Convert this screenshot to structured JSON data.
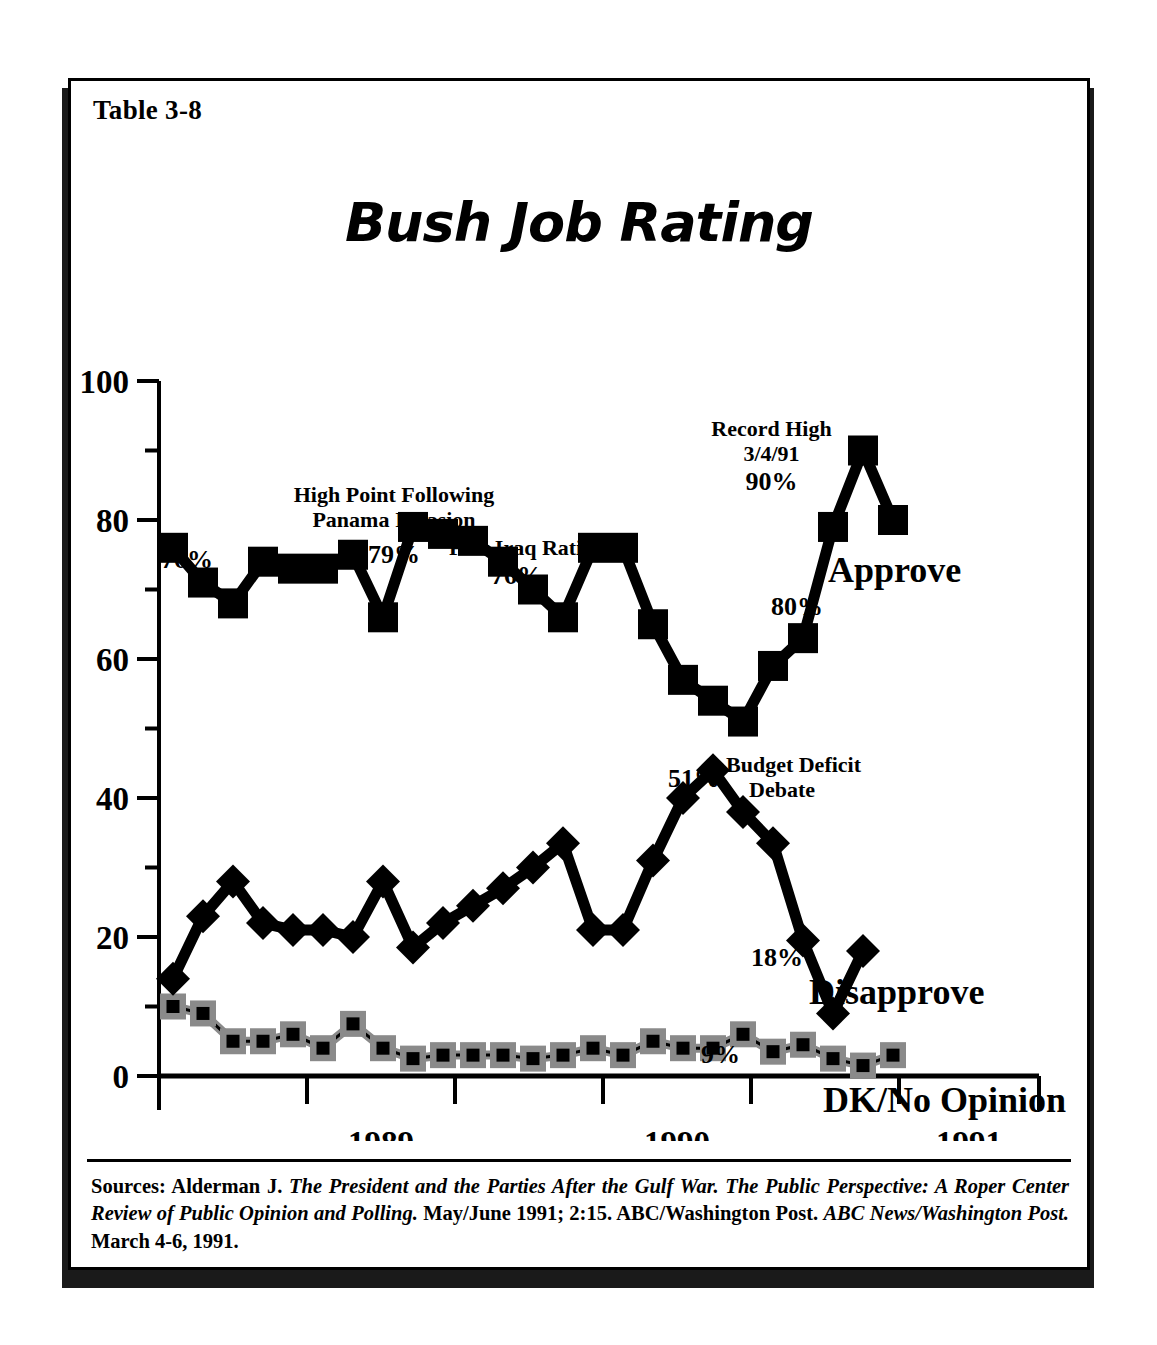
{
  "table_label": "Table 3-8",
  "title": "Bush Job Rating",
  "axes": {
    "y_ticks": [
      0,
      20,
      40,
      60,
      80,
      100
    ],
    "y_minor_ticks": [
      10,
      30,
      50,
      70,
      90
    ],
    "x_labels": [
      "1989",
      "1990",
      "1991"
    ]
  },
  "annotations": {
    "start_value": "76%",
    "panama_line1": "High Point Following",
    "panama_line2": "Panama Invasion",
    "panama_value": "79%",
    "iraq_line1": "Post Iraq Rating",
    "iraq_value": "76%",
    "record_line1": "Record High",
    "record_line2": "3/4/91",
    "record_value": "90%",
    "approve_end_value": "80%",
    "budget_value": "51%",
    "budget_line1": "Budget Deficit",
    "budget_line2": "Debate",
    "disapprove_end_value": "18%",
    "disapprove_low_value": "9%"
  },
  "series_labels": {
    "approve": "Approve",
    "disapprove": "Disapprove",
    "dk": "DK/No Opinion"
  },
  "colors": {
    "ink": "#000000",
    "dk_marker": "#8a8a8a",
    "background": "#ffffff"
  },
  "sources": {
    "prefix": "Sources: Alderman J. ",
    "italic1": "The President and the Parties After the Gulf War. The Public Perspective: A Roper Center Review of Public Opinion and Polling.",
    "mid": " May/June 1991; 2:15. ABC/Washington Post. ",
    "italic2": "ABC News/Washington Post.",
    "suffix": " March 4-6, 1991."
  },
  "chart_data": {
    "type": "line",
    "title": "Bush Job Rating",
    "xlabel": "",
    "ylabel": "",
    "ylim": [
      0,
      100
    ],
    "xlim": [
      0,
      29
    ],
    "grid": false,
    "legend": "inline-right",
    "x_tick_labels": [
      "1989",
      "1990",
      "1991"
    ],
    "x": [
      0,
      1,
      2,
      3,
      4,
      5,
      6,
      7,
      8,
      9,
      10,
      11,
      12,
      13,
      14,
      15,
      16,
      17,
      18,
      19,
      20,
      21,
      22,
      23,
      24,
      25,
      26,
      27,
      28
    ],
    "series": [
      {
        "name": "Approve",
        "marker": "square",
        "color": "#000000",
        "values": [
          76,
          71,
          68,
          74,
          73,
          73,
          75,
          66,
          79,
          78,
          77,
          74,
          70,
          66,
          76,
          76,
          65,
          57,
          54,
          51,
          59,
          63,
          79,
          90,
          80,
          null,
          null,
          null,
          null
        ]
      },
      {
        "name": "Disapprove",
        "marker": "diamond",
        "color": "#000000",
        "values": [
          14,
          23,
          28,
          22,
          21,
          21,
          20,
          28,
          18.5,
          22,
          24.5,
          27,
          30,
          33.5,
          21,
          21,
          31,
          40,
          44,
          38,
          33.5,
          19.5,
          9,
          18,
          null,
          null,
          null,
          null,
          null
        ]
      },
      {
        "name": "DK/No Opinion",
        "marker": "square-gray",
        "color": "#8a8a8a",
        "values": [
          10,
          9,
          5,
          5,
          6,
          4,
          7.5,
          4,
          2.5,
          3,
          3,
          3,
          2.5,
          3,
          4,
          3,
          5,
          4,
          4,
          6,
          3.5,
          4.5,
          2.5,
          1.5,
          3,
          null,
          null,
          null,
          null
        ]
      }
    ],
    "point_annotations": [
      {
        "series": "Approve",
        "index": 0,
        "label": "76%"
      },
      {
        "series": "Approve",
        "index": 8,
        "label": "79%",
        "note": "High Point Following Panama Invasion"
      },
      {
        "series": "Approve",
        "index": 14,
        "label": "76%",
        "note": "Post Iraq Rating"
      },
      {
        "series": "Approve",
        "index": 19,
        "label": "51%",
        "note": "Budget Deficit Debate"
      },
      {
        "series": "Approve",
        "index": 23,
        "label": "90%",
        "note": "Record High 3/4/91"
      },
      {
        "series": "Approve",
        "index": 24,
        "label": "80%"
      },
      {
        "series": "Disapprove",
        "index": 22,
        "label": "9%"
      },
      {
        "series": "Disapprove",
        "index": 23,
        "label": "18%"
      }
    ]
  }
}
